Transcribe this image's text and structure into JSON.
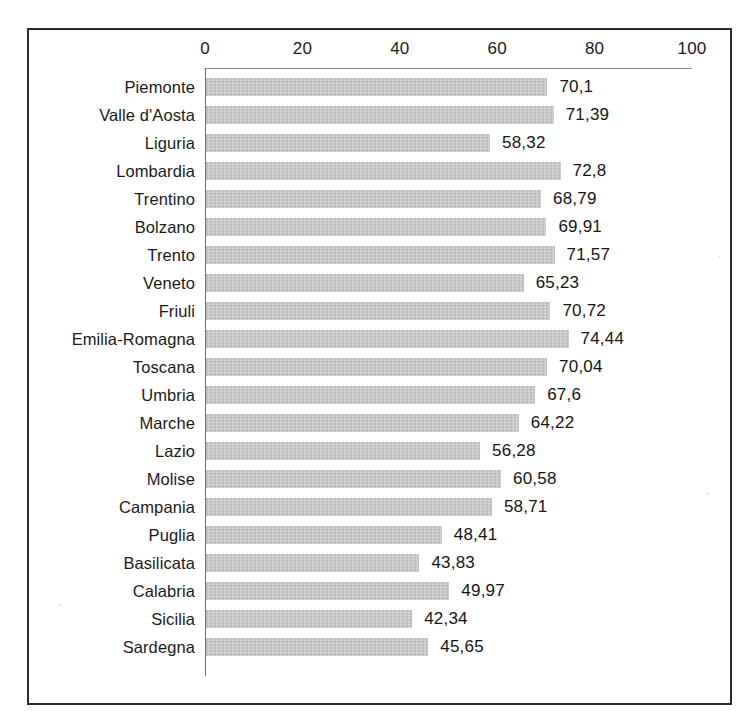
{
  "figure": {
    "frame_color": "#2b2b2b",
    "background": "#ffffff"
  },
  "chart_data": {
    "type": "bar",
    "orientation": "horizontal",
    "title": "",
    "subtitle": "",
    "xlabel": "",
    "ylabel": "",
    "xlim": [
      0,
      100
    ],
    "grid": false,
    "legend": null,
    "bar_color": "#c6c6c6",
    "axis_ticks": [
      "0",
      "20",
      "40",
      "60",
      "80",
      "100"
    ],
    "tick_values": [
      0,
      20,
      40,
      60,
      80,
      100
    ],
    "decimal_separator": ",",
    "categories": [
      "Piemonte",
      "Valle d'Aosta",
      "Liguria",
      "Lombardia",
      "Trentino",
      "Bolzano",
      "Trento",
      "Veneto",
      "Friuli",
      "Emilia-Romagna",
      "Toscana",
      "Umbria",
      "Marche",
      "Lazio",
      "Molise",
      "Campania",
      "Puglia",
      "Basilicata",
      "Calabria",
      "Sicilia",
      "Sardegna"
    ],
    "values": [
      70.1,
      71.39,
      58.32,
      72.8,
      68.79,
      69.91,
      71.57,
      65.23,
      70.72,
      74.44,
      70.04,
      67.6,
      64.22,
      56.28,
      60.58,
      58.71,
      48.41,
      43.83,
      49.97,
      42.34,
      45.65
    ],
    "value_labels": [
      "70,1",
      "71,39",
      "58,32",
      "72,8",
      "68,79",
      "69,91",
      "71,57",
      "65,23",
      "70,72",
      "74,44",
      "70,04",
      "67,6",
      "64,22",
      "56,28",
      "60,58",
      "58,71",
      "48,41",
      "43,83",
      "49,97",
      "42,34",
      "45,65"
    ]
  }
}
